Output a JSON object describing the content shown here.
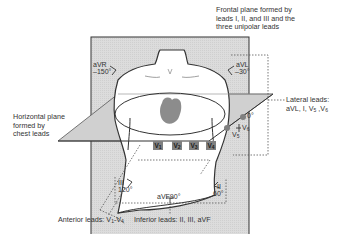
{
  "title_frontal": [
    "Frontal plane formed by",
    "leads I, II, and III and the",
    "three unipolar leads"
  ],
  "label_horizontal": [
    "Horizontal plane",
    "formed by",
    "chest leads"
  ],
  "leads": {
    "aVR": {
      "name": "aVR",
      "angle": "–150°"
    },
    "aVL": {
      "name": "aVL",
      "angle": "–30°"
    },
    "I": {
      "angle": "0°"
    },
    "II": {
      "name": "II",
      "angle": "60°"
    },
    "III": {
      "name": "III",
      "angle": "120°"
    },
    "aVF": {
      "name": "aVF",
      "angle": "90°"
    }
  },
  "chest_leads": {
    "V1": "V",
    "V1_sub": "1",
    "V2": "V",
    "V2_sub": "2",
    "V3": "V",
    "V3_sub": "3",
    "V4": "V",
    "V4_sub": "4",
    "V5": "V",
    "V5_sub": "5",
    "V6": "V",
    "V6_sub": "6"
  },
  "groups": {
    "lateral_title": "Lateral leads:",
    "lateral_list": "aVL, I, V",
    "lateral_sub1": "5",
    "lateral_mid": " ,V",
    "lateral_sub2": "6",
    "anterior": "Anterior leads: V",
    "anterior_sub1": "1",
    "anterior_dash": "-V",
    "anterior_sub2": "4",
    "inferior": "Inferior leads: II, III, aVF"
  },
  "colors": {
    "plane_fill": "#d9d9d9",
    "outline": "#333333",
    "heart": "#8c8c8c",
    "lead_box": "#808080"
  }
}
